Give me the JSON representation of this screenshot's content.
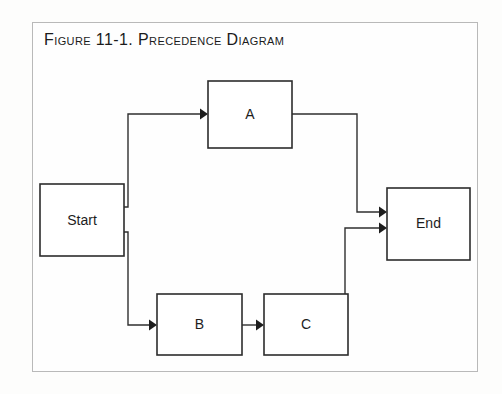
{
  "figure": {
    "caption": "Figure 11-1. Precedence Diagram",
    "frame_color": "#b9b9b9",
    "background": "#fdfdfc"
  },
  "diagram": {
    "type": "precedence-network",
    "node_stroke": "#2c2c2c",
    "connector_stroke": "#2f2f2f",
    "nodes": [
      {
        "id": "start",
        "label": "Start",
        "x": 40,
        "y": 184,
        "w": 84,
        "h": 72
      },
      {
        "id": "a",
        "label": "A",
        "x": 208,
        "y": 81,
        "w": 84,
        "h": 67
      },
      {
        "id": "b",
        "label": "B",
        "x": 157,
        "y": 294,
        "w": 85,
        "h": 61
      },
      {
        "id": "c",
        "label": "C",
        "x": 264,
        "y": 294,
        "w": 84,
        "h": 61
      },
      {
        "id": "end",
        "label": "End",
        "x": 387,
        "y": 188,
        "w": 83,
        "h": 72
      }
    ],
    "edges": [
      {
        "from": "start",
        "to": "a",
        "label": ""
      },
      {
        "from": "start",
        "to": "b",
        "label": ""
      },
      {
        "from": "a",
        "to": "end",
        "label": ""
      },
      {
        "from": "b",
        "to": "c",
        "label": ""
      },
      {
        "from": "c",
        "to": "end",
        "label": ""
      }
    ]
  }
}
